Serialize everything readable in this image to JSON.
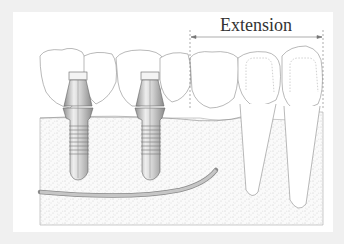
{
  "figure": {
    "extension_label": "Extension",
    "colors": {
      "frame": "#f0f0f0",
      "panel": "#ffffff",
      "outline": "#8a8a8a",
      "bone_speckle": "#c8c8c8",
      "nerve": "#9a9a9a",
      "implant": "#bdbdbd",
      "text": "#333333"
    },
    "elements": [
      {
        "type": "crown",
        "count": 7
      },
      {
        "type": "implant",
        "count": 2
      },
      {
        "type": "natural-tooth-root",
        "count": 2
      },
      {
        "type": "nerve-canal",
        "count": 1
      },
      {
        "type": "bone",
        "count": 1
      },
      {
        "type": "dimension-bracket",
        "label": "Extension"
      }
    ]
  }
}
